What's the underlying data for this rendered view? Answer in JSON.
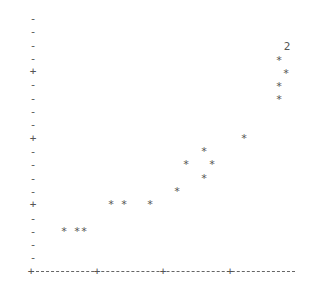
{
  "chart_data": {
    "type": "scatter",
    "title": "",
    "xlabel": "",
    "ylabel": "",
    "style": "ascii-printer-plot",
    "grid": false,
    "y_ticks": {
      "marker_minor": "-",
      "marker_major": "+",
      "rows": [
        {
          "row": 0,
          "y": 18,
          "mark": "-"
        },
        {
          "row": 1,
          "y": 31,
          "mark": "-"
        },
        {
          "row": 2,
          "y": 45,
          "mark": "-"
        },
        {
          "row": 3,
          "y": 58,
          "mark": "-"
        },
        {
          "row": 4,
          "y": 71,
          "mark": "+"
        },
        {
          "row": 5,
          "y": 84,
          "mark": "-"
        },
        {
          "row": 6,
          "y": 98,
          "mark": "-"
        },
        {
          "row": 7,
          "y": 111,
          "mark": "-"
        },
        {
          "row": 8,
          "y": 124,
          "mark": "-"
        },
        {
          "row": 9,
          "y": 138,
          "mark": "+"
        },
        {
          "row": 10,
          "y": 151,
          "mark": "-"
        },
        {
          "row": 11,
          "y": 164,
          "mark": "-"
        },
        {
          "row": 12,
          "y": 178,
          "mark": "-"
        },
        {
          "row": 13,
          "y": 191,
          "mark": "-"
        },
        {
          "row": 14,
          "y": 204,
          "mark": "+"
        },
        {
          "row": 15,
          "y": 218,
          "mark": "-"
        },
        {
          "row": 16,
          "y": 231,
          "mark": "-"
        },
        {
          "row": 17,
          "y": 244,
          "mark": "-"
        },
        {
          "row": 18,
          "y": 257,
          "mark": "-"
        }
      ]
    },
    "x_ticks": [
      {
        "col": 0,
        "x": 31,
        "mark": "+"
      },
      {
        "col": 10,
        "x": 97,
        "mark": "+"
      },
      {
        "col": 20,
        "x": 163,
        "mark": "+"
      },
      {
        "col": 30,
        "x": 230,
        "mark": "+"
      }
    ],
    "x_axis": {
      "y": 271,
      "x_start": 31,
      "x_end": 295,
      "dash_char": "-"
    },
    "points": [
      {
        "col": 5,
        "row": 16,
        "x": 64,
        "y": 231,
        "symbol": "*"
      },
      {
        "col": 7,
        "row": 16,
        "x": 77,
        "y": 231,
        "symbol": "*"
      },
      {
        "col": 8,
        "row": 16,
        "x": 84,
        "y": 231,
        "symbol": "*"
      },
      {
        "col": 12,
        "row": 14,
        "x": 111,
        "y": 204,
        "symbol": "*"
      },
      {
        "col": 14,
        "row": 14,
        "x": 124,
        "y": 204,
        "symbol": "*"
      },
      {
        "col": 18,
        "row": 14,
        "x": 150,
        "y": 204,
        "symbol": "*"
      },
      {
        "col": 22,
        "row": 13,
        "x": 177,
        "y": 191,
        "symbol": "*"
      },
      {
        "col": 23,
        "row": 11,
        "x": 186,
        "y": 164,
        "symbol": "*"
      },
      {
        "col": 26,
        "row": 10,
        "x": 204,
        "y": 151,
        "symbol": "*"
      },
      {
        "col": 27,
        "row": 11,
        "x": 212,
        "y": 164,
        "symbol": "*"
      },
      {
        "col": 26,
        "row": 12,
        "x": 204,
        "y": 178,
        "symbol": "*"
      },
      {
        "col": 32,
        "row": 9,
        "x": 244,
        "y": 138,
        "symbol": "*"
      },
      {
        "col": 37,
        "row": 6,
        "x": 279,
        "y": 99,
        "symbol": "*"
      },
      {
        "col": 37,
        "row": 5,
        "x": 279,
        "y": 86,
        "symbol": "*"
      },
      {
        "col": 38,
        "row": 4,
        "x": 286,
        "y": 73,
        "symbol": "*"
      },
      {
        "col": 37,
        "row": 3,
        "x": 279,
        "y": 60,
        "symbol": "*"
      },
      {
        "col": 38,
        "row": 2,
        "x": 287,
        "y": 46,
        "symbol": "2",
        "note": "2 overlapping points"
      }
    ]
  }
}
